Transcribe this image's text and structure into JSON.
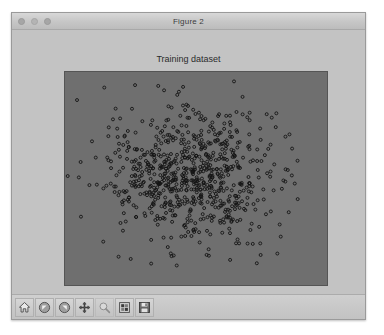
{
  "window": {
    "title": "Figure 2",
    "traffic_lights": [
      {
        "name": "close-button",
        "color": "#a6a6a6"
      },
      {
        "name": "minimize-button",
        "color": "#b4b4b4"
      },
      {
        "name": "zoom-button",
        "color": "#a6a6a6"
      }
    ]
  },
  "figure": {
    "title": "Training dataset",
    "background_color": "#c3c3c3",
    "axes_facecolor": "#6f6f6f",
    "axes_edgecolor": "#555555",
    "marker_edge_color": "#141414",
    "marker_face_color": "none"
  },
  "toolbar": {
    "buttons": [
      {
        "name": "home-icon",
        "label": "Home",
        "enabled": true
      },
      {
        "name": "back-arrow-icon",
        "label": "Back",
        "enabled": true
      },
      {
        "name": "forward-arrow-icon",
        "label": "Forward",
        "enabled": true
      },
      {
        "name": "pan-icon",
        "label": "Pan",
        "enabled": true
      },
      {
        "name": "zoom-rect-icon",
        "label": "Zoom to rectangle",
        "enabled": false
      },
      {
        "name": "configure-subplots-icon",
        "label": "Configure subplots",
        "enabled": true
      },
      {
        "name": "save-icon",
        "label": "Save the figure",
        "enabled": true
      }
    ]
  },
  "chart_data": {
    "type": "scatter",
    "title": "Training dataset",
    "xlabel": "",
    "ylabel": "",
    "xlim": [
      -4.0,
      4.0
    ],
    "ylim": [
      -4.0,
      4.0
    ],
    "grid": false,
    "legend": null,
    "axis_ticks_visible": false,
    "n_points": 760,
    "marker": "o",
    "marker_size": 3,
    "distribution": "gaussian-cluster",
    "center": [
      -0.15,
      0.05
    ],
    "spread": [
      1.35,
      1.25
    ],
    "series": [
      {
        "name": "training samples",
        "color": "#141414",
        "points_note": "Dense isotropic Gaussian cloud of ~760 open-circle markers centred slightly left of the axes centre; density falls off smoothly toward the edges with sparse outliers near the frame."
      }
    ]
  }
}
